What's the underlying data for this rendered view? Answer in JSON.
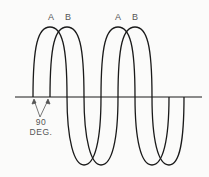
{
  "labels": {
    "wave_a_1": "A",
    "wave_b_1": "B",
    "wave_a_2": "A",
    "wave_b_2": "B",
    "phase_value": "90",
    "phase_unit": "DEG."
  },
  "colors": {
    "line": "#1a1a1a",
    "text": "#555555",
    "background": "#fbfbfa"
  },
  "geometry": {
    "axis_y": 97,
    "peak_y": 27,
    "trough_y": 165,
    "wave_a_crossings_x": [
      33,
      67,
      117,
      152,
      169
    ],
    "wave_b_crossings_x": [
      49,
      84,
      135,
      169,
      184
    ]
  }
}
